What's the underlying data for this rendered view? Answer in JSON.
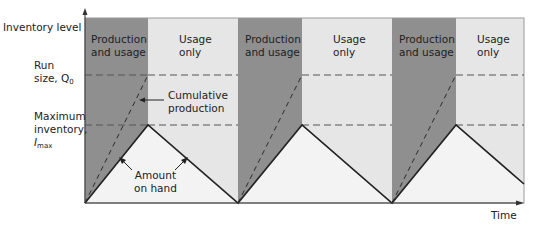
{
  "axes": {
    "y_label": "Inventory level",
    "x_label": "Time"
  },
  "y_markers": {
    "run_size": {
      "line1": "Run",
      "line2": "size, Q",
      "subscript": "0"
    },
    "max_inventory": {
      "line1": "Maximum",
      "line2": "inventory,",
      "line3": "I",
      "subscript": "max"
    }
  },
  "phases": [
    {
      "line1": "Production",
      "line2": "and usage"
    },
    {
      "line1": "Usage",
      "line2": "only"
    },
    {
      "line1": "Production",
      "line2": "and usage"
    },
    {
      "line1": "Usage",
      "line2": "only"
    },
    {
      "line1": "Production",
      "line2": "and usage"
    },
    {
      "line1": "Usage",
      "line2": "only"
    }
  ],
  "annotations": {
    "cumulative": {
      "line1": "Cumulative",
      "line2": "production"
    },
    "on_hand": {
      "line1": "Amount",
      "line2": "on hand"
    }
  },
  "colors": {
    "production_band": "#8f8f8f",
    "usage_band": "#e6e6e6",
    "triangle_fill": "#f3f3f3",
    "line": "#222222",
    "dashed": "#555555",
    "frame": "#9a9a9a"
  }
}
